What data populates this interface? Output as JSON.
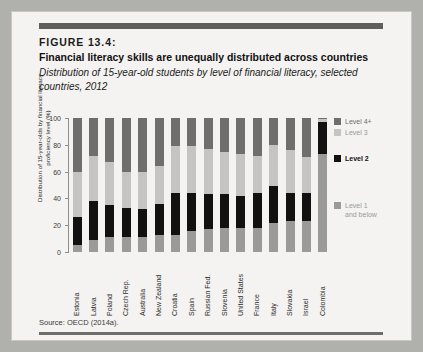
{
  "figure": {
    "label": "FIGURE 13.4:",
    "headline": "Financial literacy skills are unequally distributed across countries",
    "subtitle": "Distribution of 15-year-old students by level of financial literacy, selected countries, 2012",
    "source": "Source: OECD (2014a)."
  },
  "colors": {
    "page_background": "#b0b0ad",
    "card_background": "#f4f3f1",
    "rule": "#5e5e5c",
    "level1": "#9a9a98",
    "level2": "#111111",
    "level3": "#c4c4c2",
    "level4": "#6e6e6c",
    "axis": "#8d8d8a"
  },
  "legend": {
    "position": "right",
    "entries": [
      {
        "label": "Level 4+",
        "color": "#6e6e6c",
        "bold": false
      },
      {
        "label": "Level 3",
        "color": "#c4c4c2",
        "bold": false
      },
      {
        "label": "Level 2",
        "color": "#111111",
        "bold": true
      },
      {
        "label": "Level 1 and below",
        "color": "#9a9a98",
        "bold": false
      }
    ]
  },
  "chart_data": {
    "type": "bar",
    "subtype": "stacked-vertical-100pct",
    "title": "Financial literacy skills are unequally distributed across countries",
    "subtitle": "Distribution of 15-year-old students by level of financial literacy, selected countries, 2012",
    "xlabel": "",
    "ylabel": "Distribution of 15-year-olds by financial literacy proficiency level (%)",
    "ylim": [
      0,
      100
    ],
    "yticks": [
      0,
      20,
      40,
      60,
      80,
      100
    ],
    "ytick_labels": [
      "0",
      "20",
      "40",
      "60",
      "80",
      "100"
    ],
    "grid": false,
    "legend_position": "right",
    "categories": [
      "Estonia",
      "Latvia",
      "Poland",
      "Czech Rep.",
      "Australia",
      "New Zealand",
      "Croatia",
      "Spain",
      "Russian Fed.",
      "Slovenia",
      "United States",
      "France",
      "Italy",
      "Slovakia",
      "Israel",
      "Colombia"
    ],
    "series": [
      {
        "name": "Level 1 and below",
        "color": "#9a9a98",
        "values": [
          5,
          9,
          11,
          11,
          11,
          13,
          13,
          16,
          17,
          18,
          18,
          18,
          22,
          23,
          23,
          73
        ]
      },
      {
        "name": "Level 2",
        "color": "#111111",
        "values": [
          21,
          29,
          24,
          22,
          21,
          23,
          31,
          28,
          26,
          25,
          24,
          26,
          27,
          21,
          21,
          24
        ]
      },
      {
        "name": "Level 3",
        "color": "#c4c4c2",
        "values": [
          34,
          34,
          32,
          27,
          28,
          28,
          35,
          35,
          34,
          32,
          31,
          28,
          31,
          32,
          27,
          2
        ]
      },
      {
        "name": "Level 4+",
        "color": "#6e6e6c",
        "values": [
          40,
          28,
          33,
          40,
          40,
          36,
          21,
          21,
          23,
          25,
          27,
          28,
          20,
          24,
          29,
          1
        ]
      }
    ]
  }
}
